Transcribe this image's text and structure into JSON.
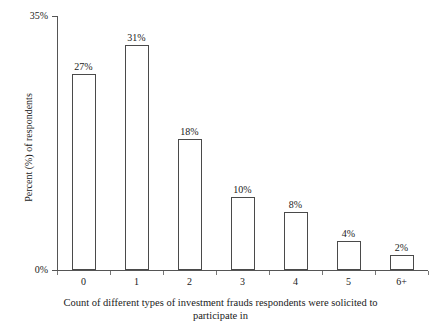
{
  "chart_data": {
    "type": "bar",
    "title": "",
    "subtitle": "",
    "categories": [
      "0",
      "1",
      "2",
      "3",
      "4",
      "5",
      "6+"
    ],
    "values": [
      27,
      31,
      18,
      10,
      8,
      4,
      2
    ],
    "value_labels": [
      "27%",
      "31%",
      "18%",
      "10%",
      "8%",
      "4%",
      "2%"
    ],
    "xlabel": "Count of different types of investment frauds respondents were solicited to participate in",
    "xlabel_line1": "Count of different types of investment frauds respondents were solicited to",
    "xlabel_line2": "participate in",
    "ylabel": "Percent (%) of respondents",
    "ylim": [
      0,
      35
    ],
    "ytick_values": [
      0,
      35
    ],
    "ytick_labels": [
      "0%",
      "35%"
    ],
    "grid": false,
    "legend": false,
    "bar_fill_color": "#ffffff",
    "bar_edge_color": "#4a4a4a",
    "axis_color": "#555555",
    "text_color": "#1a1a1a",
    "background_color": "#ffffff"
  }
}
